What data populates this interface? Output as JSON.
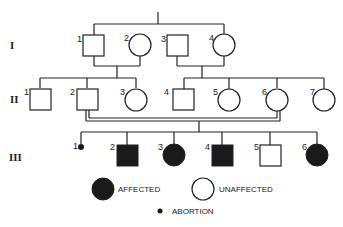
{
  "diagram": {
    "type": "pedigree",
    "generations": [
      {
        "label": "I",
        "individuals": [
          {
            "id": "I-1",
            "number": "1",
            "sex": "male",
            "status": "unaffected"
          },
          {
            "id": "I-2",
            "number": "2",
            "sex": "female",
            "status": "unaffected"
          },
          {
            "id": "I-3",
            "number": "3",
            "sex": "male",
            "status": "unaffected"
          },
          {
            "id": "I-4",
            "number": "4",
            "sex": "female",
            "status": "unaffected"
          }
        ]
      },
      {
        "label": "II",
        "individuals": [
          {
            "id": "II-1",
            "number": "1",
            "sex": "male",
            "status": "unaffected"
          },
          {
            "id": "II-2",
            "number": "2",
            "sex": "male",
            "status": "unaffected"
          },
          {
            "id": "II-3",
            "number": "3",
            "sex": "female",
            "status": "unaffected"
          },
          {
            "id": "II-4",
            "number": "4",
            "sex": "male",
            "status": "unaffected"
          },
          {
            "id": "II-5",
            "number": "5",
            "sex": "female",
            "status": "unaffected"
          },
          {
            "id": "II-6",
            "number": "6",
            "sex": "female",
            "status": "unaffected"
          },
          {
            "id": "II-7",
            "number": "7",
            "sex": "female",
            "status": "unaffected"
          }
        ]
      },
      {
        "label": "III",
        "individuals": [
          {
            "id": "III-1",
            "number": "1",
            "sex": "unknown",
            "status": "abortion"
          },
          {
            "id": "III-2",
            "number": "2",
            "sex": "male",
            "status": "affected"
          },
          {
            "id": "III-3",
            "number": "3",
            "sex": "female",
            "status": "affected"
          },
          {
            "id": "III-4",
            "number": "4",
            "sex": "male",
            "status": "affected"
          },
          {
            "id": "III-5",
            "number": "5",
            "sex": "male",
            "status": "unaffected"
          },
          {
            "id": "III-6",
            "number": "6",
            "sex": "female",
            "status": "affected"
          }
        ]
      }
    ],
    "matings": [
      {
        "partners": [
          "I-1",
          "I-2"
        ],
        "children": [
          "II-1",
          "II-2",
          "II-3"
        ]
      },
      {
        "partners": [
          "I-3",
          "I-4"
        ],
        "children": [
          "II-4",
          "II-5",
          "II-6",
          "II-7"
        ]
      },
      {
        "partners": [
          "II-2",
          "II-6"
        ],
        "consanguineous": true,
        "children": [
          "III-1",
          "III-2",
          "III-3",
          "III-4",
          "III-5",
          "III-6"
        ]
      }
    ],
    "legend": {
      "affected": "AFFECTED",
      "unaffected": "UNAFFECTED",
      "abortion": "ABORTION"
    },
    "colors": {
      "line": "#222222",
      "affected_fill": "#1a1a1a",
      "unaffected_fill": "#ffffff"
    }
  }
}
